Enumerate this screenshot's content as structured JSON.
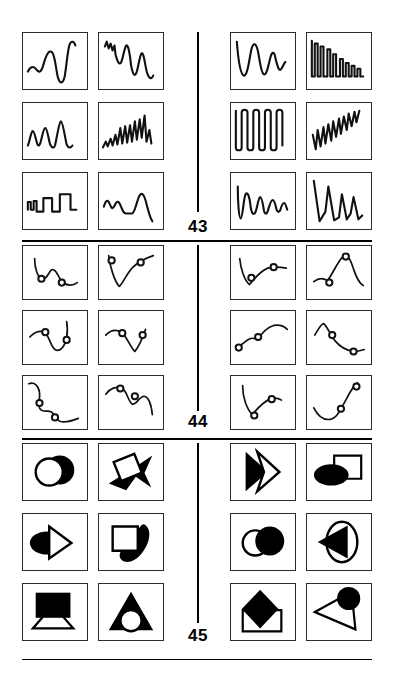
{
  "page": {
    "background": "#ffffff",
    "ink": "#000000",
    "width": 395,
    "height": 676,
    "kind": "figure-plate"
  },
  "layout": {
    "columns_per_half": 2,
    "rows": 3,
    "halves": 2,
    "cell_width": 65,
    "cell_height": 55,
    "divider_color": "#000000"
  },
  "sections": [
    {
      "id": "sec-43",
      "number": "43",
      "caption_kind": "waveform-traces",
      "top": 30,
      "divider": {
        "x": 197,
        "top": 2,
        "height": 180
      },
      "number_pos": {
        "x": 178,
        "y": 188
      },
      "cells": [
        {
          "id": "c43-1",
          "name": "waveform-smooth-ripple-to-deep-valley",
          "half": "left",
          "row": 1,
          "col": 1
        },
        {
          "id": "c43-2",
          "name": "waveform-jagged-descending-oscillation",
          "half": "left",
          "row": 1,
          "col": 2
        },
        {
          "id": "c43-3",
          "name": "waveform-sparse-sharp-spikes",
          "half": "left",
          "row": 2,
          "col": 1
        },
        {
          "id": "c43-4",
          "name": "waveform-growing-spike-train",
          "half": "left",
          "row": 2,
          "col": 2
        },
        {
          "id": "c43-5",
          "name": "waveform-square-step-pulses",
          "half": "left",
          "row": 3,
          "col": 1
        },
        {
          "id": "c43-6",
          "name": "waveform-rounded-humps-falling-tail",
          "half": "left",
          "row": 3,
          "col": 2
        },
        {
          "id": "c43-7",
          "name": "waveform-damped-sine-decay",
          "half": "right",
          "row": 1,
          "col": 1
        },
        {
          "id": "c43-8",
          "name": "waveform-decaying-square-comb",
          "half": "right",
          "row": 1,
          "col": 2
        },
        {
          "id": "c43-9",
          "name": "waveform-deep-square-wave",
          "half": "right",
          "row": 2,
          "col": 1
        },
        {
          "id": "c43-10",
          "name": "waveform-rising-sawtooth-ramp",
          "half": "right",
          "row": 2,
          "col": 2
        },
        {
          "id": "c43-11",
          "name": "waveform-shrinking-dips",
          "half": "right",
          "row": 3,
          "col": 1
        },
        {
          "id": "c43-12",
          "name": "waveform-tall-triangular-peaks",
          "half": "right",
          "row": 3,
          "col": 2
        }
      ]
    },
    {
      "id": "sec-44",
      "number": "44",
      "caption_kind": "curves-with-circle-markers",
      "top": 243,
      "divider": {
        "x": 197,
        "top": 2,
        "height": 166
      },
      "number_pos": {
        "x": 178,
        "y": 172
      },
      "cells": [
        {
          "id": "c44-1",
          "name": "curve-hook-down-two-markers",
          "half": "left",
          "row": 1,
          "col": 1,
          "markers": 2
        },
        {
          "id": "c44-2",
          "name": "curve-v-shape-two-markers",
          "half": "left",
          "row": 1,
          "col": 2,
          "markers": 2
        },
        {
          "id": "c44-3",
          "name": "curve-valley-rise-two-markers",
          "half": "left",
          "row": 2,
          "col": 1,
          "markers": 2
        },
        {
          "id": "c44-4",
          "name": "curve-descend-notch-two-markers",
          "half": "left",
          "row": 2,
          "col": 2,
          "markers": 2
        },
        {
          "id": "c44-5",
          "name": "curve-double-s-two-markers",
          "half": "left",
          "row": 3,
          "col": 1,
          "markers": 2
        },
        {
          "id": "c44-6",
          "name": "curve-double-arch-two-markers",
          "half": "left",
          "row": 3,
          "col": 2,
          "markers": 2
        },
        {
          "id": "c44-7",
          "name": "curve-dip-then-plateau-two-markers",
          "half": "right",
          "row": 1,
          "col": 1,
          "markers": 2
        },
        {
          "id": "c44-8",
          "name": "curve-peak-with-shoulder-two-markers",
          "half": "right",
          "row": 1,
          "col": 2,
          "markers": 2
        },
        {
          "id": "c44-9",
          "name": "curve-rising-arch-two-markers",
          "half": "right",
          "row": 2,
          "col": 1,
          "markers": 2
        },
        {
          "id": "c44-10",
          "name": "curve-falling-slope-two-markers",
          "half": "right",
          "row": 2,
          "col": 2,
          "markers": 2
        },
        {
          "id": "c44-11",
          "name": "curve-hook-rise-two-markers",
          "half": "right",
          "row": 3,
          "col": 1,
          "markers": 2
        },
        {
          "id": "c44-12",
          "name": "curve-scoop-up-two-markers",
          "half": "right",
          "row": 3,
          "col": 2,
          "markers": 2
        }
      ]
    },
    {
      "id": "sec-45",
      "number": "45",
      "caption_kind": "overlapping-geometric-figures",
      "top": 441,
      "divider": {
        "x": 197,
        "top": 2,
        "height": 180
      },
      "number_pos": {
        "x": 178,
        "y": 188
      },
      "cells": [
        {
          "id": "c45-1",
          "name": "figure-open-circle-over-black-disc",
          "half": "left",
          "row": 1,
          "col": 1
        },
        {
          "id": "c45-2",
          "name": "figure-white-square-on-black-arrowhead",
          "half": "left",
          "row": 1,
          "col": 2
        },
        {
          "id": "c45-3",
          "name": "figure-black-ellipse-with-open-triangle",
          "half": "left",
          "row": 2,
          "col": 1
        },
        {
          "id": "c45-4",
          "name": "figure-white-square-on-black-blob",
          "half": "left",
          "row": 2,
          "col": 2
        },
        {
          "id": "c45-5",
          "name": "figure-black-rect-over-open-triangle",
          "half": "left",
          "row": 3,
          "col": 1
        },
        {
          "id": "c45-6",
          "name": "figure-white-circle-in-black-triangle",
          "half": "left",
          "row": 3,
          "col": 2
        },
        {
          "id": "c45-7",
          "name": "figure-black-triangle-with-open-chevron",
          "half": "right",
          "row": 1,
          "col": 1
        },
        {
          "id": "c45-8",
          "name": "figure-black-ellipse-with-open-square",
          "half": "right",
          "row": 1,
          "col": 2
        },
        {
          "id": "c45-9",
          "name": "figure-open-circle-and-black-disc",
          "half": "right",
          "row": 2,
          "col": 1
        },
        {
          "id": "c45-10",
          "name": "figure-black-triangle-in-open-ellipse",
          "half": "right",
          "row": 2,
          "col": 2
        },
        {
          "id": "c45-11",
          "name": "figure-black-diamond-over-open-rect",
          "half": "right",
          "row": 3,
          "col": 1
        },
        {
          "id": "c45-12",
          "name": "figure-black-disc-on-open-triangle",
          "half": "right",
          "row": 3,
          "col": 2
        }
      ]
    }
  ]
}
